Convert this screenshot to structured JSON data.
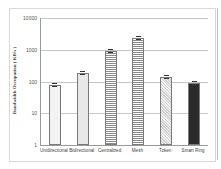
{
  "chart_data": {
    "type": "bar",
    "title": "",
    "xlabel": "",
    "ylabel": "Bandwidth Occupation ( KB/s )",
    "yscale": "log",
    "ylim": [
      1,
      10000
    ],
    "yticks": [
      "1",
      "10",
      "100",
      "1000",
      "10000"
    ],
    "grid": true,
    "legend": "none",
    "error_bars": true,
    "categories": [
      "Unidirectional",
      "Bidirectional",
      "Centralized",
      "Mesh",
      "Token",
      "Smart Ring"
    ],
    "values": [
      75,
      190,
      900,
      2400,
      140,
      90
    ],
    "patterns": [
      "plain",
      "light",
      "horizontal-lines",
      "horizontal-lines",
      "dots",
      "dark"
    ]
  }
}
